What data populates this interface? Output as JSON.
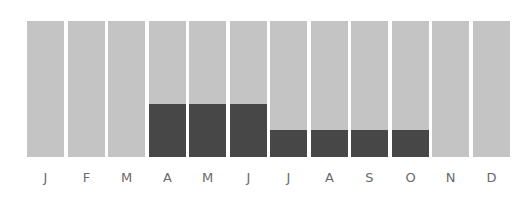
{
  "chart_data": {
    "type": "bar",
    "stacked": true,
    "title": "",
    "xlabel": "",
    "ylabel": "",
    "categories": [
      "J",
      "F",
      "M",
      "A",
      "M",
      "J",
      "J",
      "A",
      "S",
      "O",
      "N",
      "D"
    ],
    "series": [
      {
        "name": "highlighted",
        "color": "#474747",
        "values": [
          0,
          0,
          0,
          39,
          39,
          39,
          20,
          20,
          20,
          20,
          0,
          0
        ]
      },
      {
        "name": "background",
        "color": "#c4c4c4",
        "values": [
          100,
          100,
          100,
          61,
          61,
          61,
          80,
          80,
          80,
          80,
          100,
          100
        ]
      }
    ],
    "ylim": [
      0,
      100
    ],
    "grid": false,
    "legend": "none"
  },
  "colors": {
    "bar_background": "#c4c4c4",
    "bar_fill": "#474747",
    "label": "#6a6a6a"
  }
}
